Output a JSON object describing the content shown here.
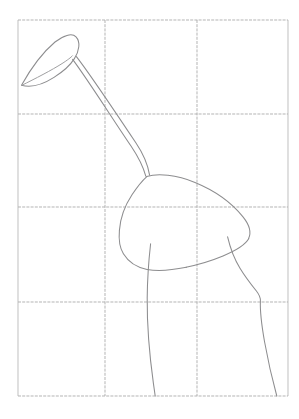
{
  "document": {
    "title": "Bird contour sketch on grid",
    "medium": "pencil line drawing",
    "background_color": "#ffffff",
    "stroke_color": "#8d8d8f",
    "grid_color": "#b0b0b0",
    "canvas": {
      "width": 299,
      "height": 419
    }
  },
  "grid": {
    "name": "proportion-grid",
    "columns": 3,
    "rows": 4,
    "x_positions": [
      18,
      105,
      197,
      288
    ],
    "y_positions": [
      20,
      114,
      207,
      302,
      396
    ],
    "style": "light dashed pencil ruling"
  },
  "subject": {
    "name": "wading-bird",
    "parts": [
      {
        "id": "head",
        "label": "head and beak",
        "description": "elongated teardrop pointing down-left",
        "tip": [
          21,
          85
        ],
        "crown": [
          60,
          35
        ]
      },
      {
        "id": "neck",
        "label": "neck",
        "description": "long straight diagonal from head to body",
        "from": [
          72,
          62
        ],
        "to": [
          146,
          176
        ]
      },
      {
        "id": "body",
        "label": "body",
        "description": "rounded quadrilateral mass",
        "extent": [
          119,
          172,
          249,
          271
        ]
      },
      {
        "id": "leg-left",
        "label": "front leg",
        "description": "near-vertical line to ground",
        "top": [
          151,
          244
        ],
        "bottom": [
          155,
          396
        ]
      },
      {
        "id": "leg-right",
        "label": "rear leg",
        "description": "angled line with bend to ground",
        "top": [
          228,
          237
        ],
        "bottom": [
          277,
          396
        ]
      }
    ]
  },
  "strokes": {
    "head_outline": "M21.5,85.2 C30,70 42,53 55,42 C63,35.5 72,32.6 76,36.8 C80.8,41.8 79.2,51 74.4,58.6 C70.4,65 63,71.6 54,77.4 C43,84.4 31,88 21.5,85.2 Z",
    "head_inner_edge": "M21.6,85.4 C35,78.8 52,70 62,63.6 C67.6,60 70.8,57.6 72.4,55.8",
    "neck_left": "M72.6,59.4 C86,77 112,118 131,146 C138,156.4 143.6,168 145.8,176.2",
    "neck_right": "M76.4,56.6 C90,74 118,116 136,143 C143,153.4 148,165 149.6,175.2",
    "body_top": "M146.6,176.4 C158,173.2 176,174.6 195,182.4 C214,190.2 232,203 243,216.8 C249.4,224.8 251.4,232.6 248.6,238.4",
    "body_right": "M248.8,238.6 C245.6,244.6 236,250.6 223,256 C211,261 198,264.8 186,267.2",
    "body_bottom": "M186.4,267.3 C172,270.2 158,271.4 147,269.4 C136.4,267.4 128.4,262 123.4,253.8 C119.6,247.6 118.6,239.6 119.4,230.6",
    "body_left": "M119.4,230.4 C120.2,219.4 124.6,206 132,194.8 C137.4,186.6 143,180 146.8,176.6",
    "leg_left": "M150.6,243.8 C149,258 147.4,277 147.2,298 C147,324 149.6,356 153.4,383.4 C154.2,389 154.8,393 155.2,396",
    "leg_right": "M227.6,236.8 C230,247 234,258.4 240,268.2 C245.6,277.4 251.6,285 256.4,291 C259.4,294.8 260.6,297.8 260.4,301 C260,310 261.4,324 264.6,342 C268,361 272.4,380 276.8,396"
  }
}
